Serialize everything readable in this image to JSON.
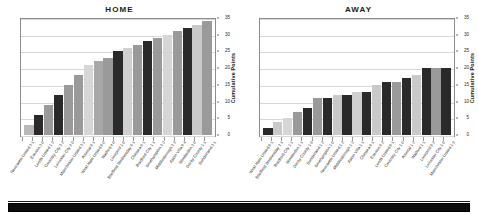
{
  "figure": {
    "y_axis_title": "Cumulative Points",
    "y_ticks": [
      35,
      30,
      25,
      20,
      15,
      10,
      5,
      0
    ],
    "footer_label": ""
  },
  "panels": [
    {
      "title": "HOME"
    },
    {
      "title": "AWAY"
    }
  ],
  "chart_data": [
    {
      "type": "bar",
      "title": "HOME",
      "xlabel": "",
      "ylabel": "Cumulative Points",
      "ylim": [
        0,
        35
      ],
      "grid": true,
      "legend": "none",
      "categories": [
        "Newcastle United",
        "Everton",
        "Leeds United",
        "Coventry City",
        "Leicester City",
        "Manchester United",
        "Arsenal",
        "West Ham United",
        "Watford",
        "Liverpool",
        "Sheffield Wednesday",
        "Chelsea",
        "Bradford City",
        "Southampton",
        "Middlesbrough",
        "Aston Villa",
        "Wimbledon",
        "Derby County",
        "Sunderland"
      ],
      "scores": [
        "3-1",
        "3-0",
        "1-2",
        "3-2",
        "2-0",
        "3-1",
        "0-1",
        "0-0",
        "4-0",
        "1-0",
        "0-1",
        "0-1",
        "1-1",
        "2-2",
        "2-3",
        "0-4",
        "2-0",
        "1-1",
        "3-1"
      ],
      "values": [
        3,
        6,
        9,
        12,
        15,
        18,
        21,
        22,
        23,
        25,
        26,
        27,
        28,
        29,
        30,
        31,
        32,
        33,
        34
      ],
      "bar_colors": [
        "#b9b9b9",
        "#2a2a2a",
        "#9a9a9a",
        "#2a2a2a",
        "#9a9a9a",
        "#9a9a9a",
        "#d6d6d6",
        "#a8a8a8",
        "#9a9a9a",
        "#2a2a2a",
        "#d0d0d0",
        "#9a9a9a",
        "#2a2a2a",
        "#9a9a9a",
        "#d6d6d6",
        "#9a9a9a",
        "#2a2a2a",
        "#c9c9c9",
        "#9a9a9a"
      ]
    },
    {
      "type": "bar",
      "title": "AWAY",
      "xlabel": "",
      "ylabel": "Cumulative Points",
      "ylim": [
        0,
        35
      ],
      "grid": true,
      "legend": "none",
      "categories": [
        "West Ham United",
        "Sheffield Wednesday",
        "Bradford City",
        "Wimbledon",
        "Derby County",
        "Sunderland",
        "Southampton",
        "Newcastle United",
        "Middlesbrough",
        "Aston Villa",
        "Chelsea",
        "Everton",
        "Leeds United",
        "Coventry City",
        "Arsenal",
        "Watford",
        "Liverpool",
        "Leicester City",
        "Manchester United"
      ],
      "scores": [
        "0-1",
        "2-1",
        "1-1",
        "1-1",
        "1-0",
        "1-2",
        "1-0",
        "1-2",
        "1-2",
        "1-1",
        "0-1",
        "0-2",
        "0-1",
        "1-0",
        "1-2",
        "1-1",
        "0-2",
        "1-0",
        "1-3"
      ],
      "values": [
        2,
        4,
        5,
        7,
        8,
        11,
        11,
        12,
        12,
        13,
        13,
        15,
        16,
        16,
        17,
        18,
        20,
        20,
        20
      ],
      "bar_colors": [
        "#2a2a2a",
        "#c9c9c9",
        "#d6d6d6",
        "#9a9a9a",
        "#2a2a2a",
        "#9a9a9a",
        "#2a2a2a",
        "#c9c9c9",
        "#2a2a2a",
        "#d0d0d0",
        "#2a2a2a",
        "#c9c9c9",
        "#2a2a2a",
        "#9a9a9a",
        "#2a2a2a",
        "#c9c9c9",
        "#2a2a2a",
        "#9a9a9a",
        "#2a2a2a"
      ]
    }
  ]
}
